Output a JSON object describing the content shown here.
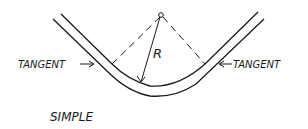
{
  "diagram": {
    "title": "SIMPLE",
    "center_label": "R",
    "left_label": "TANGENT",
    "right_label": "TANGENT",
    "colors": {
      "ink": "#1a1a1a",
      "background": "#ffffff"
    }
  }
}
